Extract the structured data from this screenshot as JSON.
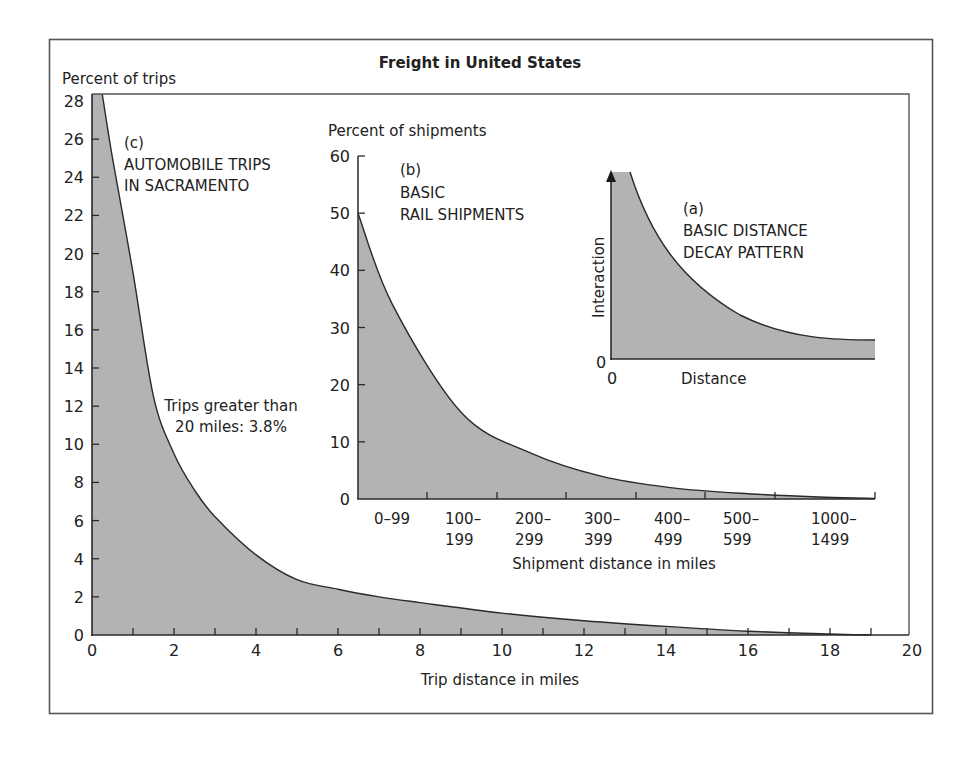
{
  "figure": {
    "title": "Freight in United States",
    "fill_color": "#b3b3b3",
    "line_color": "#2a2a2a",
    "frame_color": "#555555"
  },
  "chart_data": [
    {
      "id": "c",
      "type": "area",
      "title": "(c) AUTOMOBILE TRIPS IN SACRAMENTO",
      "panel_label": "(c)",
      "caption_lines": [
        "AUTOMOBILE TRIPS",
        "IN SACRAMENTO"
      ],
      "annotation_lines": [
        "Trips greater than",
        "20 miles: 3.8%"
      ],
      "xlabel": "Trip distance in miles",
      "ylabel": "Percent of trips",
      "xlim": [
        0,
        20
      ],
      "ylim": [
        0,
        28
      ],
      "xticks": [
        0,
        2,
        4,
        6,
        8,
        10,
        12,
        14,
        16,
        18,
        20
      ],
      "yticks": [
        0,
        2,
        4,
        6,
        8,
        10,
        12,
        14,
        16,
        18,
        20,
        22,
        24,
        26,
        28
      ],
      "grid": false,
      "x": [
        0,
        0.25,
        0.5,
        1,
        1.5,
        2,
        2.5,
        3,
        4,
        5,
        6,
        7,
        8,
        10,
        12,
        14,
        16,
        18,
        19
      ],
      "y": [
        28,
        28,
        25,
        19,
        12.5,
        9.5,
        7.6,
        6.2,
        4.2,
        2.9,
        2.4,
        2.0,
        1.7,
        1.15,
        0.75,
        0.45,
        0.2,
        0.05,
        0
      ]
    },
    {
      "id": "b",
      "type": "area",
      "title": "(b) BASIC RAIL SHIPMENTS",
      "panel_label": "(b)",
      "caption_lines": [
        "BASIC",
        "RAIL SHIPMENTS"
      ],
      "xlabel": "Shipment distance in miles",
      "ylabel": "Percent of shipments",
      "ylim": [
        0,
        60
      ],
      "yticks": [
        0,
        10,
        20,
        30,
        40,
        50,
        60
      ],
      "categories": [
        "0–99",
        "100–199",
        "200–299",
        "300–399",
        "400–499",
        "500–599",
        "1000–1499"
      ],
      "category_lines": [
        [
          "0–99",
          ""
        ],
        [
          "100–",
          "199"
        ],
        [
          "200–",
          "299"
        ],
        [
          "300–",
          "399"
        ],
        [
          "400–",
          "499"
        ],
        [
          "500–",
          "599"
        ],
        [
          "1000–",
          "1499"
        ]
      ],
      "values": [
        34,
        15,
        8,
        4,
        2,
        1,
        0.3
      ],
      "curve_start": 50,
      "grid": false
    },
    {
      "id": "a",
      "type": "area",
      "title": "(a) BASIC DISTANCE DECAY PATTERN",
      "panel_label": "(a)",
      "caption_lines": [
        "BASIC DISTANCE",
        "DECAY PATTERN"
      ],
      "xlabel": "Distance",
      "ylabel": "Interaction",
      "x_origin_label": "0",
      "y_origin_label": "0",
      "description": "Conceptual exponential decay curve, no numeric scale",
      "grid": false
    }
  ]
}
